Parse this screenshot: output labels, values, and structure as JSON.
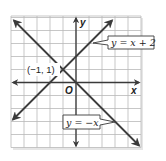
{
  "chart_data": {
    "type": "line",
    "title": "",
    "xlabel": "x",
    "ylabel": "y",
    "xlim": [
      -5,
      5
    ],
    "ylim": [
      -5,
      5
    ],
    "grid": true,
    "grid_step": 1,
    "origin_label": "O",
    "series": [
      {
        "name": "y = x + 2",
        "equation": "y = x + 2",
        "slope": 1,
        "intercept": 2,
        "x": [
          -4.85,
          2.77
        ],
        "y": [
          -2.85,
          4.77
        ],
        "arrows": "both"
      },
      {
        "name": "y = −x",
        "equation": "y = −x",
        "slope": -1,
        "intercept": 0,
        "x": [
          -4.77,
          4.85
        ],
        "y": [
          4.77,
          -4.85
        ],
        "arrows": "both"
      }
    ],
    "annotations": [
      {
        "text": "(−1, 1)",
        "x": -1,
        "y": 1,
        "type": "intersection-point"
      },
      {
        "text": "y = x + 2",
        "type": "line-callout",
        "series": 0
      },
      {
        "text": "y = −x",
        "type": "line-callout",
        "series": 1
      }
    ],
    "colors": {
      "grid": "#b9b9b9",
      "axes": "#3a3a3a",
      "lines": "#3c3c3c",
      "background": "#ffffff"
    }
  },
  "labels": {
    "x_axis": "x",
    "y_axis": "y",
    "origin": "O",
    "intersection": "(−1, 1)",
    "line1_callout": "y = x + 2",
    "line2_callout": "y = −x"
  }
}
